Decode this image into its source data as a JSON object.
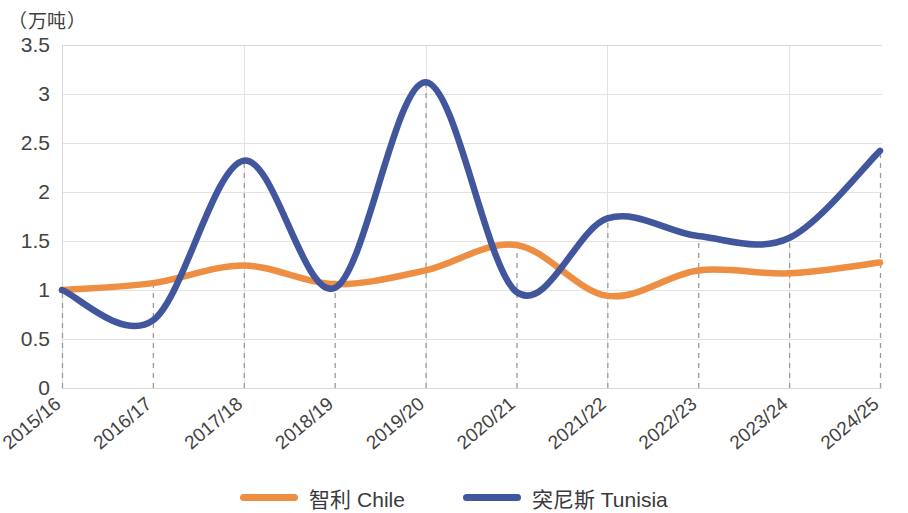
{
  "chart_data": {
    "type": "line",
    "title": "",
    "subtitle": "",
    "xlabel": "",
    "ylabel": "（万吨）",
    "unit_caption": "（万吨）",
    "categories": [
      "2015/16",
      "2016/17",
      "2017/18",
      "2018/19",
      "2019/20",
      "2020/21",
      "2021/22",
      "2022/23",
      "2023/24",
      "2024/25"
    ],
    "ylim": [
      0,
      3.5
    ],
    "ytick_values": [
      0,
      0.5,
      1,
      1.5,
      2,
      2.5,
      3,
      3.5
    ],
    "ytick_labels": [
      "0",
      "0.5",
      "1",
      "1.5",
      "2",
      "2.5",
      "3",
      "3.5"
    ],
    "grid": true,
    "grid_axis": "y",
    "legend_position": "bottom-center",
    "smooth": true,
    "series": [
      {
        "name": "智利 Chile",
        "color": "#ED8E42",
        "values": [
          1.0,
          1.07,
          1.25,
          1.06,
          1.2,
          1.46,
          0.94,
          1.2,
          1.17,
          1.28
        ]
      },
      {
        "name": "突尼斯 Tunisia",
        "color": "#41569C",
        "values": [
          1.0,
          0.69,
          2.32,
          1.02,
          3.12,
          0.98,
          1.73,
          1.55,
          1.53,
          2.42
        ]
      }
    ]
  },
  "legend": {
    "items": [
      {
        "label": "智利 Chile",
        "color": "#ED8E42"
      },
      {
        "label": "突尼斯 Tunisia",
        "color": "#41569C"
      }
    ]
  },
  "axis": {
    "unit_caption": "（万吨）"
  }
}
